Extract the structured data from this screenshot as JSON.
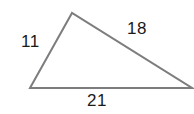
{
  "figure": {
    "shape": "triangle",
    "background_color": "#ffffff",
    "stroke_color": "#7d7d80",
    "stroke_width": 2,
    "text_color": "#1a1a1a",
    "vertices": {
      "left": {
        "x": 30,
        "y": 88
      },
      "top": {
        "x": 72,
        "y": 13
      },
      "right": {
        "x": 192,
        "y": 88
      }
    },
    "sides": [
      {
        "name": "left-side",
        "label": "11",
        "from": "left",
        "to": "top"
      },
      {
        "name": "right-side",
        "label": "18",
        "from": "top",
        "to": "right"
      },
      {
        "name": "bottom-side",
        "label": "21",
        "from": "left",
        "to": "right"
      }
    ]
  },
  "chart_data": {
    "type": "diagram",
    "categories": [
      "left side",
      "right side",
      "bottom side"
    ],
    "values": [
      11,
      18,
      21
    ],
    "labels": [
      "11",
      "18",
      "21"
    ],
    "xlabel": "",
    "ylabel": "",
    "annotations": [
      {
        "text": "11",
        "position": "left-of-left-side"
      },
      {
        "text": "18",
        "position": "above-right-side"
      },
      {
        "text": "21",
        "position": "below-bottom-side"
      }
    ]
  }
}
